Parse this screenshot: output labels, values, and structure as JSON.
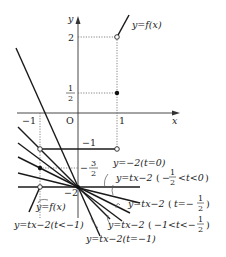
{
  "figure": {
    "type": "function graph with family of lines",
    "axes": {
      "x_label": "x",
      "y_label": "y",
      "origin_label": "O",
      "x_ticks": [
        "-1",
        "1"
      ],
      "y_ticks": [
        "2",
        "1/2",
        "-1",
        "-3/2",
        "-2"
      ]
    },
    "curve_label": "y=f(x)",
    "curve_label_lower": "y=f(x)",
    "line_labels": {
      "t_zero": "y=−2(t=0)",
      "t_neg_half_to_zero": "y=tx−2(−1/2<t<0)",
      "t_neg_half": "y=tx−2(t=−1/2)",
      "t_neg_one_to_neg_half": "y=tx−2(−1<t<−1/2)",
      "t_neg_one": "y=tx−2(t=−1)",
      "t_lt_neg_one": "y=tx−2(t<−1)"
    },
    "text": {
      "y": "y",
      "x": "x",
      "O": "O",
      "neg1_x": "−1",
      "one_x": "1",
      "two": "2",
      "half_num": "1",
      "half_den": "2",
      "neg1_y": "−1",
      "neg32_sign": "−",
      "neg32_num": "3",
      "neg32_den": "2",
      "neg2": "−2",
      "yf_top": "y=f(x)",
      "yf_bottom": "y=f(x)",
      "l0": "y=−2(t=0)",
      "l1_a": "y=tx−2",
      "l1_b": "−",
      "l1_num": "1",
      "l1_den": "2",
      "l1_c": "<t<0",
      "l2_a": "y=tx−2",
      "l2_b": "t=−",
      "l2_num": "1",
      "l2_den": "2",
      "l3_a": "y=tx−2",
      "l3_b": "−1<t<−",
      "l3_num": "1",
      "l3_den": "2",
      "l4": "y=tx−2(t=−1)",
      "l5": "y=tx−2(t<−1)"
    }
  }
}
